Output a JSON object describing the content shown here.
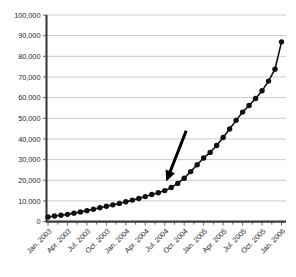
{
  "chart_data": {
    "type": "line",
    "title": "",
    "subtitle": "",
    "xlabel": "",
    "ylabel": "",
    "ylim": [
      0,
      100000
    ],
    "ytick_values": [
      0,
      10000,
      20000,
      30000,
      40000,
      50000,
      60000,
      70000,
      80000,
      90000,
      100000
    ],
    "ytick_labels": [
      "0",
      "10,000",
      "20,000",
      "30,000",
      "40,000",
      "50,000",
      "60,000",
      "70,000",
      "80,000",
      "90,000",
      "100,000"
    ],
    "grid": true,
    "grid_axis": "y",
    "legend": false,
    "legend_position": "none",
    "marker": "filled-circle",
    "series_color": "#111111",
    "grid_color": "#bdbdbd",
    "axis_color": "#3a3a3a",
    "xtick_labels": [
      "Jan. 2003",
      "Apr. 2003",
      "Jul. 2003",
      "Oct. 2003",
      "Jan. 2004",
      "Apr. 2004",
      "Jul. 2004",
      "Oct. 2004",
      "Jan. 2005",
      "Apr. 2005",
      "Jul. 2005",
      "Oct. 2005",
      "Jan. 2006"
    ],
    "xtick_label_rotation": -45,
    "x": [
      "Jan. 2003",
      "Feb. 2003",
      "Mar. 2003",
      "Apr. 2003",
      "May 2003",
      "Jun. 2003",
      "Jul. 2003",
      "Aug. 2003",
      "Sep. 2003",
      "Oct. 2003",
      "Nov. 2003",
      "Dec. 2003",
      "Jan. 2004",
      "Feb. 2004",
      "Mar. 2004",
      "Apr. 2004",
      "May 2004",
      "Jun. 2004",
      "Jul. 2004",
      "Aug. 2004",
      "Sep. 2004",
      "Oct. 2004",
      "Nov. 2004",
      "Dec. 2004",
      "Jan. 2005",
      "Feb. 2005",
      "Mar. 2005",
      "Apr. 2005",
      "May 2005",
      "Jun. 2005",
      "Jul. 2005",
      "Aug. 2005",
      "Sep. 2005",
      "Oct. 2005",
      "Nov. 2005",
      "Dec. 2005",
      "Jan. 2006"
    ],
    "values": [
      2200,
      2700,
      3100,
      3500,
      4100,
      4700,
      5300,
      6000,
      6700,
      7400,
      8100,
      8800,
      9600,
      10400,
      11200,
      12100,
      13100,
      14000,
      15000,
      16500,
      18500,
      21000,
      24200,
      27500,
      30800,
      33500,
      36800,
      40700,
      44800,
      49000,
      53000,
      56200,
      59600,
      63300,
      68000,
      73800,
      87000
    ],
    "series": [
      {
        "name": "value",
        "values": [
          2200,
          2700,
          3100,
          3500,
          4100,
          4700,
          5300,
          6000,
          6700,
          7400,
          8100,
          8800,
          9600,
          10400,
          11200,
          12100,
          13100,
          14000,
          15000,
          16500,
          18500,
          21000,
          24200,
          27500,
          30800,
          33500,
          36800,
          40700,
          44800,
          49000,
          53000,
          56200,
          59600,
          63300,
          68000,
          73800,
          87000
        ]
      }
    ],
    "annotations": [
      {
        "type": "arrow",
        "label": "",
        "points_to_x": "Jul. 2004",
        "points_to_y": 15000,
        "tail_x": "Oct. 2004",
        "tail_y": 44000,
        "color": "#000000"
      }
    ]
  }
}
